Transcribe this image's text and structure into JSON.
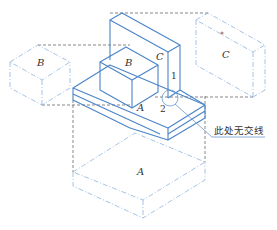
{
  "diagram": {
    "type": "isometric-decomposition",
    "parts": [
      {
        "id": "A",
        "label": "A",
        "description": "base slab"
      },
      {
        "id": "B",
        "label": "B",
        "description": "cube on base"
      },
      {
        "id": "C",
        "label": "C",
        "description": "vertical plate on base"
      }
    ],
    "labels": {
      "assembled_A": "A",
      "assembled_B": "B",
      "assembled_C": "C",
      "exploded_A": "A",
      "exploded_B": "B",
      "exploded_C": "C",
      "face_1": "1",
      "face_2": "2"
    },
    "annotation": {
      "text": "此处无交线"
    },
    "colors": {
      "solid_line": "#4a84c8",
      "ghost_line": "#8fb4dd",
      "projection_line": "#555555"
    }
  }
}
